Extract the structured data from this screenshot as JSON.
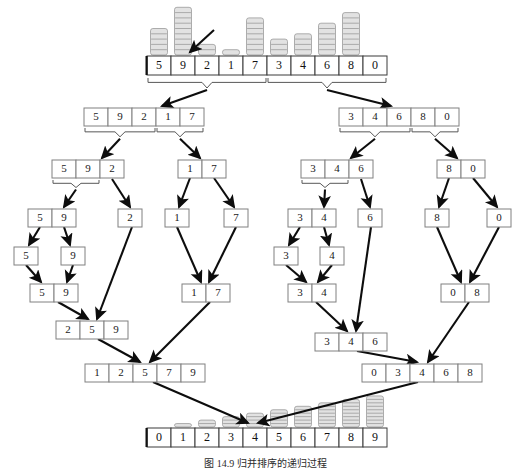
{
  "figure": {
    "caption": "图 14.9  归并排序的递归过程",
    "accent_color": "#0d0d0d",
    "bar_fill": "#e2e2e2",
    "bar_stroke": "#9a9a9a",
    "box_stroke": "#808080"
  },
  "chart_data": {
    "type": "bar",
    "xlabel": "",
    "ylabel": "",
    "grid": false,
    "legend": null,
    "ylim": [
      0,
      9
    ],
    "panels": [
      {
        "name": "input-array",
        "position": "top",
        "categories": [
          "5",
          "9",
          "2",
          "1",
          "7",
          "3",
          "4",
          "6",
          "8",
          "0"
        ],
        "values": [
          5,
          9,
          2,
          1,
          7,
          3,
          4,
          6,
          8,
          0
        ]
      },
      {
        "name": "sorted-array",
        "position": "bottom",
        "categories": [
          "0",
          "1",
          "2",
          "3",
          "4",
          "5",
          "6",
          "7",
          "8",
          "9"
        ],
        "values": [
          0,
          1,
          2,
          3,
          4,
          5,
          6,
          7,
          8,
          9
        ]
      }
    ]
  },
  "nodes": {
    "root": [
      "5",
      "9",
      "2",
      "1",
      "7",
      "3",
      "4",
      "6",
      "8",
      "0"
    ],
    "split_left": [
      "5",
      "9",
      "2",
      "1",
      "7"
    ],
    "split_right": [
      "3",
      "4",
      "6",
      "8",
      "0"
    ],
    "l_592": [
      "5",
      "9",
      "2"
    ],
    "l_17": [
      "1",
      "7"
    ],
    "r_346": [
      "3",
      "4",
      "6"
    ],
    "r_80": [
      "8",
      "0"
    ],
    "l_59": [
      "5",
      "9"
    ],
    "l_2": [
      "2"
    ],
    "l_1": [
      "1"
    ],
    "l_7": [
      "7"
    ],
    "r_34": [
      "3",
      "4"
    ],
    "r_6": [
      "6"
    ],
    "r_8": [
      "8"
    ],
    "r_0": [
      "0"
    ],
    "l_5_leaf": [
      "5"
    ],
    "l_9_leaf": [
      "9"
    ],
    "r_3_leaf": [
      "3"
    ],
    "r_4_leaf": [
      "4"
    ],
    "m_59": [
      "5",
      "9"
    ],
    "m_17": [
      "1",
      "7"
    ],
    "m_34": [
      "3",
      "4"
    ],
    "m_08": [
      "0",
      "8"
    ],
    "m_259": [
      "2",
      "5",
      "9"
    ],
    "m_346": [
      "3",
      "4",
      "6"
    ],
    "m_12579": [
      "1",
      "2",
      "5",
      "7",
      "9"
    ],
    "m_03468": [
      "0",
      "3",
      "4",
      "6",
      "8"
    ],
    "result": [
      "0",
      "1",
      "2",
      "3",
      "4",
      "5",
      "6",
      "7",
      "8",
      "9"
    ]
  }
}
